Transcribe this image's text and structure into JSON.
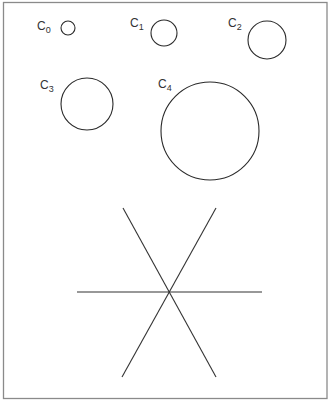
{
  "diagram": {
    "colors": {
      "frame": "#8a8a8a",
      "stroke": "#2a2a2a",
      "text": "#333333"
    },
    "circles": [
      {
        "label": "C",
        "subscript": "0",
        "cx": 68,
        "cy": 28,
        "r": 7,
        "label_x": 37,
        "label_y": 30
      },
      {
        "label": "C",
        "subscript": "1",
        "cx": 164,
        "cy": 33,
        "r": 13,
        "label_x": 130,
        "label_y": 27
      },
      {
        "label": "C",
        "subscript": "2",
        "cx": 267,
        "cy": 40,
        "r": 19,
        "label_x": 228,
        "label_y": 27
      },
      {
        "label": "C",
        "subscript": "3",
        "cx": 87,
        "cy": 104,
        "r": 26,
        "label_x": 40,
        "label_y": 89
      },
      {
        "label": "C",
        "subscript": "4",
        "cx": 210,
        "cy": 131,
        "r": 49,
        "label_x": 158,
        "label_y": 88
      }
    ],
    "star": {
      "center": [
        170,
        292
      ],
      "lines": [
        {
          "x1": 77,
          "y1": 292,
          "x2": 262,
          "y2": 292
        },
        {
          "x1": 123,
          "y1": 208,
          "x2": 216,
          "y2": 377
        },
        {
          "x1": 216,
          "y1": 208,
          "x2": 122,
          "y2": 377
        }
      ]
    }
  }
}
